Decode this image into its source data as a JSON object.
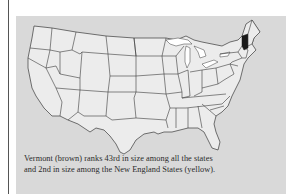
{
  "figure": {
    "caption_line1": "Vermont (brown) ranks 43rd in size among all the states",
    "caption_line2": "and 2nd in size among the New England States (yellow).",
    "highlighted_state": "Vermont",
    "region_group": "New England States",
    "rank_overall": "43rd",
    "rank_in_region": "2nd",
    "colors": {
      "panel": "#d9d9d9",
      "states": "#ececec",
      "borders": "#3a3a3a",
      "highlight": "#1a1a1a",
      "water": "#ffffff"
    }
  }
}
